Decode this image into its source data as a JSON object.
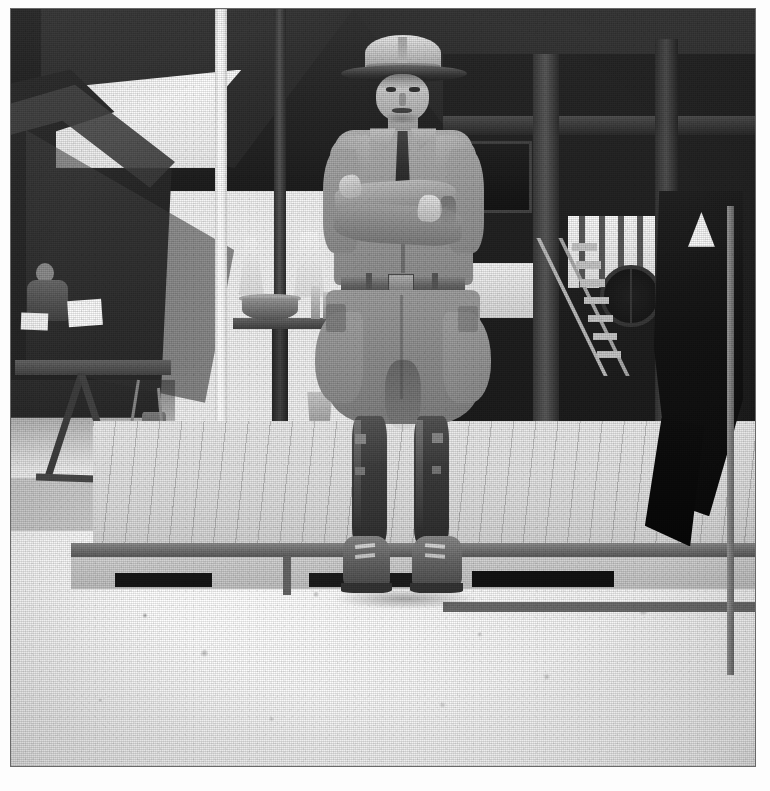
{
  "document": {
    "type": "photograph",
    "medium": "halftone-printed black-and-white photograph",
    "orientation": "portrait",
    "border": "white paper margin with thin grey rule",
    "tone": "high-contrast monochrome, blown-out sandy foreground, deep black tent shadows"
  },
  "scene": {
    "title": "Soldier standing with arms crossed at a military camp",
    "setting": "Military encampment - canvas wall tents and a raised wooden platform/building on sandy ground",
    "era_cues": "Montana-peak campaign hat, wool service shirt with necktie, riding breeches, leather leggings, field boots"
  },
  "subject": {
    "label": "Soldier",
    "pose": "standing at ease, facing camera, arms folded across chest",
    "expression": "stern, mouth turned down",
    "items": [
      {
        "name": "campaign-hat",
        "label": "Campaign hat (Montana peak)",
        "tone": "light crown, dark brim"
      },
      {
        "name": "service-shirt",
        "label": "Wool service shirt",
        "tone": "mid grey"
      },
      {
        "name": "necktie",
        "label": "Dark necktie",
        "tone": "near black"
      },
      {
        "name": "waist-belt",
        "label": "Waist belt with buckle",
        "tone": "dark grey"
      },
      {
        "name": "riding-breeches",
        "label": "Flared riding breeches",
        "tone": "mid grey"
      },
      {
        "name": "leather-leggings",
        "label": "Leather leggings / puttees",
        "tone": "dark"
      },
      {
        "name": "field-boots",
        "label": "Laced field boots",
        "tone": "mid to dark grey"
      }
    ]
  },
  "background": {
    "elements": [
      {
        "name": "tent-canopy",
        "label": "Dark canvas canopy overhead"
      },
      {
        "name": "wall-tent-left",
        "label": "Wall tent at left with open flap"
      },
      {
        "name": "seated-figure",
        "label": "Seated figure inside the left tent"
      },
      {
        "name": "camp-table",
        "label": "Folding camp table with X-frame legs"
      },
      {
        "name": "tent-pole",
        "label": "White vertical tent pole"
      },
      {
        "name": "wooden-post",
        "label": "Dark wooden post"
      },
      {
        "name": "washstand",
        "label": "Shelf with wash basin and bottles"
      },
      {
        "name": "hanging-towels",
        "label": "Pale hanging towels"
      },
      {
        "name": "bucket",
        "label": "Metal bucket on the ground"
      },
      {
        "name": "wooden-deck",
        "label": "Raised wooden deck / plank platform"
      },
      {
        "name": "building-frame",
        "label": "Dark timber-framed building at right"
      },
      {
        "name": "barred-window",
        "label": "Bright barred opening"
      },
      {
        "name": "ladder",
        "label": "Wooden ladder leaning against the platform"
      },
      {
        "name": "wagon-wheel",
        "label": "Wagon wheel in shadow"
      },
      {
        "name": "hanging-cloth",
        "label": "Large dark cloth hanging at far right"
      },
      {
        "name": "sandy-ground",
        "label": "Bright sandy foreground with scattered debris"
      }
    ]
  },
  "caption": {
    "text": ""
  },
  "palette": {
    "paper_white": "#fdfdfd",
    "print_border": "#6b6b6b",
    "highlight": "#fbfbfb",
    "midtone": "#9a9a9a",
    "shadow": "#3a3a3a",
    "black": "#141414"
  }
}
